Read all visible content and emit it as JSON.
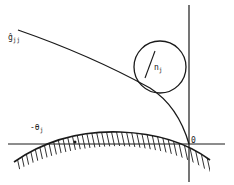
{
  "diagram": {
    "colors": {
      "ink": "#1a1a1a",
      "background": "#ffffff"
    },
    "labels": {
      "curve_label": {
        "main": "ĝ",
        "sub": "jj"
      },
      "radius_label": {
        "main": "n",
        "sub": "j"
      },
      "angle_label": {
        "main": "-θ",
        "sub": "j"
      },
      "origin_label": "0"
    },
    "elements": [
      {
        "id": "vertical-axis",
        "type": "line"
      },
      {
        "id": "horizontal-axis",
        "type": "line"
      },
      {
        "id": "curve-g-jj",
        "type": "curve"
      },
      {
        "id": "circle",
        "type": "circle",
        "radius_label": "n_j"
      },
      {
        "id": "hatched-boundary",
        "type": "hatched-arc"
      }
    ]
  }
}
